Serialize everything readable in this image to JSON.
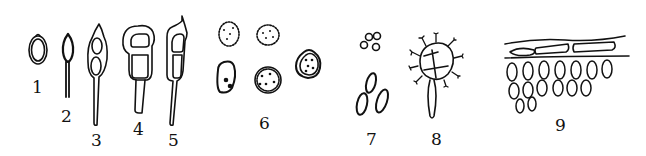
{
  "figure": {
    "ink_color": "#111111",
    "background": "#ffffff",
    "labels": [
      {
        "id": "1",
        "text": "1",
        "x": 34,
        "y": 80
      },
      {
        "id": "2",
        "text": "2",
        "x": 63,
        "y": 108
      },
      {
        "id": "3",
        "text": "3",
        "x": 91,
        "y": 132
      },
      {
        "id": "4",
        "text": "4",
        "x": 132,
        "y": 120
      },
      {
        "id": "5",
        "text": "5",
        "x": 168,
        "y": 132
      },
      {
        "id": "6",
        "text": "6",
        "x": 259,
        "y": 116
      },
      {
        "id": "7",
        "text": "7",
        "x": 366,
        "y": 132
      },
      {
        "id": "8",
        "text": "8",
        "x": 431,
        "y": 132
      },
      {
        "id": "9",
        "text": "9",
        "x": 553,
        "y": 118
      }
    ]
  }
}
